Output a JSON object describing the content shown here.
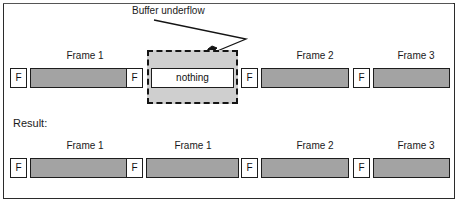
{
  "figure": {
    "annotation": {
      "label": "Buffer underflow"
    },
    "result_label": "Result:",
    "nothing_label": "nothing",
    "flag_label": "F",
    "colors": {
      "payload_fill": "#a3a3a3",
      "underflow_fill": "#cfcfcf",
      "stroke": "#1d1d1d",
      "background": "#ffffff"
    },
    "stream_top": {
      "name": "incoming-stream",
      "slots": [
        {
          "caption": "Frame 1",
          "flag": "F",
          "kind": "payload"
        },
        {
          "caption": "",
          "flag": "F",
          "kind": "underflow",
          "body": "nothing"
        },
        {
          "caption": "Frame 2",
          "flag": "F",
          "kind": "payload"
        },
        {
          "caption": "Frame 3",
          "flag": "F",
          "kind": "payload"
        }
      ]
    },
    "stream_result": {
      "name": "result-stream",
      "slots": [
        {
          "caption": "Frame 1",
          "flag": "F",
          "kind": "payload"
        },
        {
          "caption": "Frame 1",
          "flag": "F",
          "kind": "payload"
        },
        {
          "caption": "Frame 2",
          "flag": "F",
          "kind": "payload"
        },
        {
          "caption": "Frame 3",
          "flag": "F",
          "kind": "payload"
        }
      ]
    }
  }
}
